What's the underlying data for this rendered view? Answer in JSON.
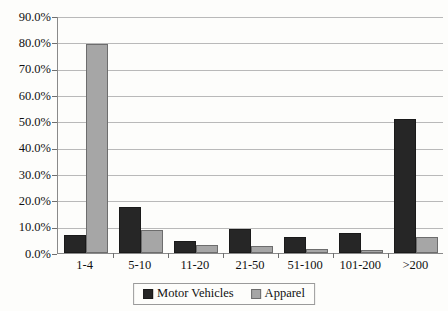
{
  "chart_data": {
    "type": "bar",
    "title": "",
    "subtitle": "",
    "xlabel": "",
    "ylabel": "",
    "categories": [
      "1-4",
      "5-10",
      "11-20",
      "21-50",
      "51-100",
      "101-200",
      ">200"
    ],
    "series": [
      {
        "name": "Motor Vehicles",
        "color": "#262626",
        "values": [
          6.8,
          17.5,
          4.5,
          9.0,
          6.0,
          7.5,
          50.8
        ]
      },
      {
        "name": "Apparel",
        "color": "#a6a6a6",
        "values": [
          79.5,
          8.8,
          3.0,
          2.5,
          1.6,
          1.3,
          6.0
        ]
      }
    ],
    "ylim": [
      0,
      90
    ],
    "ytick_step": 10,
    "ytick_labels": [
      "0.0%",
      "10.0%",
      "20.0%",
      "30.0%",
      "40.0%",
      "50.0%",
      "60.0%",
      "70.0%",
      "80.0%",
      "90.0%"
    ],
    "ytick_values": [
      0,
      10,
      20,
      30,
      40,
      50,
      60,
      70,
      80,
      90
    ],
    "grid": {
      "horizontal": true,
      "vertical": false
    },
    "legend": {
      "position": "bottom",
      "bordered": true
    },
    "legend_entries": [
      "Motor Vehicles",
      "Apparel"
    ]
  },
  "colors": {
    "series_0": "#262626",
    "series_1": "#a6a6a6",
    "gridline": "#b9b9b9",
    "axis": "#8a8a8a",
    "background": "#fdfdfb",
    "text": "#111111"
  }
}
